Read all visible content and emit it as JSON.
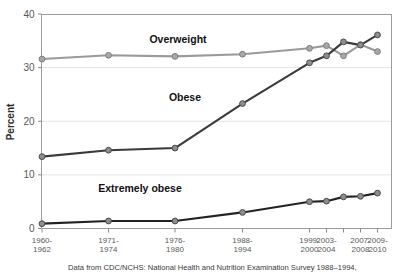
{
  "chart_data": {
    "type": "line",
    "title": "",
    "subtitle": "",
    "xlabel": "",
    "ylabel": "Percent",
    "ylim": [
      0,
      40
    ],
    "yticks": [
      0,
      10,
      20,
      30,
      40
    ],
    "ytick_labels": [
      "0",
      "10",
      "20",
      "30",
      "40"
    ],
    "grid": true,
    "grid_axis": "y",
    "legend_position": "inline-annotation",
    "categories": [
      "1960-1962",
      "1971-1974",
      "1976-1980",
      "1988-1994",
      "1999-2000",
      "2003-2004",
      "2005-2006",
      "2007-2008",
      "2009-2010"
    ],
    "xtick_labels": [
      [
        "1960-",
        "1962"
      ],
      [
        "1971-",
        "1974"
      ],
      [
        "1976-",
        "1980"
      ],
      [
        "1988-",
        "1994"
      ],
      [
        "1999-",
        "2000"
      ],
      [
        "2003-",
        "2004"
      ],
      [
        "",
        ""
      ],
      [
        "2007-",
        "2008"
      ],
      [
        "2009-",
        "2010"
      ]
    ],
    "series": [
      {
        "name": "Overweight",
        "color": "#9a9a9a",
        "marker_class": "marker-light",
        "values": [
          31.6,
          32.3,
          32.1,
          32.5,
          33.6,
          34.1,
          32.2,
          34.3,
          33.0
        ]
      },
      {
        "name": "Obese",
        "color": "#3a3a3a",
        "marker_class": "marker-dark",
        "values": [
          13.4,
          14.6,
          15.0,
          23.3,
          30.9,
          32.2,
          34.8,
          34.2,
          36.1
        ]
      },
      {
        "name": "Extremely obese",
        "color": "#222222",
        "marker_class": "marker-dark",
        "values": [
          0.9,
          1.4,
          1.4,
          3.0,
          5.0,
          5.1,
          5.9,
          6.0,
          6.6
        ]
      }
    ],
    "annotations": [
      {
        "text": "Overweight",
        "x": 178,
        "y": 43
      },
      {
        "text": "Obese",
        "x": 185,
        "y": 101
      },
      {
        "text": "Extremely obese",
        "x": 140,
        "y": 192
      }
    ],
    "caption": "Data from CDC/NCHS: National Health and Nutrition Examination Survey 1988–1994,"
  },
  "axis": {
    "y_title": "Percent"
  }
}
